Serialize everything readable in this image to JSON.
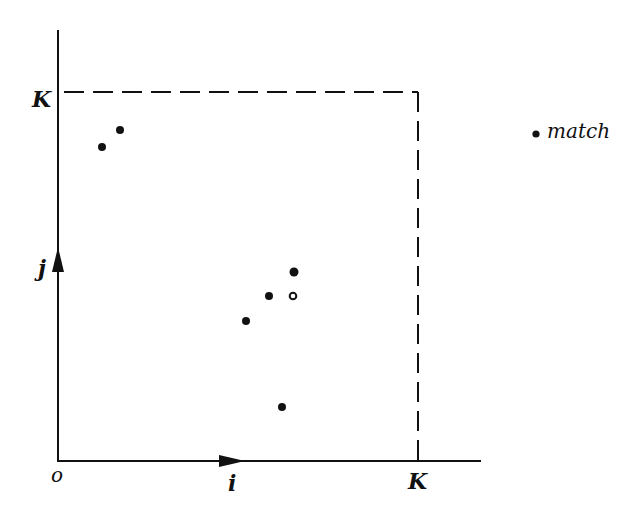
{
  "diagram": {
    "axes": {
      "x_label": "i",
      "y_label": "j",
      "origin_label": "o",
      "x_bound_label": "K",
      "y_bound_label": "K"
    },
    "legend": {
      "items": [
        {
          "symbol": "filled-dot",
          "label": "match"
        }
      ]
    },
    "points": [
      {
        "x": 102,
        "y": 147,
        "type": "filled"
      },
      {
        "x": 120,
        "y": 130,
        "type": "filled"
      },
      {
        "x": 294,
        "y": 272,
        "type": "filled"
      },
      {
        "x": 269,
        "y": 296,
        "type": "filled"
      },
      {
        "x": 293,
        "y": 296,
        "type": "open"
      },
      {
        "x": 246,
        "y": 321,
        "type": "filled"
      },
      {
        "x": 282,
        "y": 407,
        "type": "filled"
      }
    ],
    "colors": {
      "ink": "#111111",
      "background": "#ffffff"
    }
  }
}
